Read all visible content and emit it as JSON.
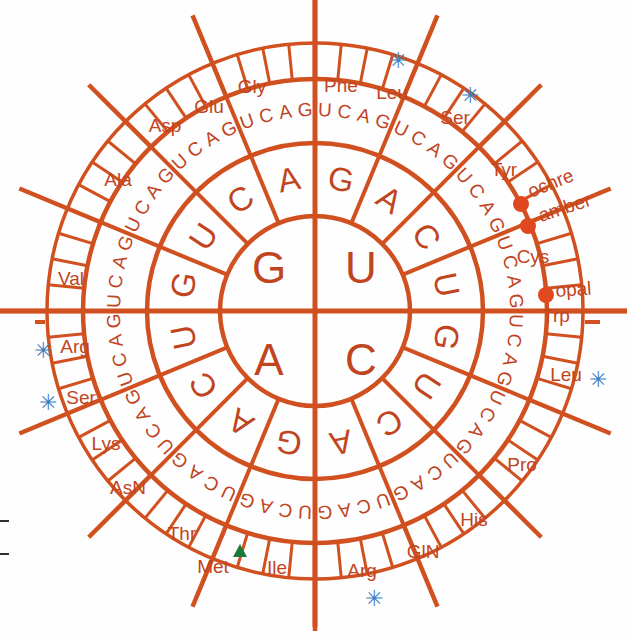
{
  "diagram": {
    "colors": {
      "line": "#d1501f",
      "text": "#c0451f",
      "asterisk": "#3f7fbf",
      "start_marker": "#1a7a3c",
      "stop_dot": "#e0491f",
      "background": "#ffffff"
    },
    "center": {
      "quadrants": [
        {
          "base": "G",
          "position": "top-left"
        },
        {
          "base": "U",
          "position": "top-right"
        },
        {
          "base": "A",
          "position": "bottom-left"
        },
        {
          "base": "C",
          "position": "bottom-right"
        }
      ]
    },
    "ring2_bases": [
      "G",
      "A",
      "C",
      "U",
      "G",
      "U",
      "C",
      "A",
      "G",
      "A",
      "C",
      "U",
      "G",
      "U",
      "C",
      "A"
    ],
    "ring3_bases": [
      "U",
      "C",
      "A",
      "G"
    ],
    "amino_acids": [
      {
        "label": "Gly",
        "x": 252,
        "y": 93,
        "anchor": "middle",
        "rot": 0
      },
      {
        "label": "Phe",
        "x": 341,
        "y": 92,
        "anchor": "middle",
        "rot": 0
      },
      {
        "label": "Leu",
        "x": 392,
        "y": 99,
        "anchor": "middle",
        "rot": 0
      },
      {
        "label": "Ser",
        "x": 455,
        "y": 124,
        "anchor": "middle",
        "rot": 0
      },
      {
        "label": "Tyr",
        "x": 504,
        "y": 176,
        "anchor": "middle",
        "rot": 0
      },
      {
        "label": "Cys",
        "x": 533,
        "y": 263,
        "anchor": "middle",
        "rot": 0
      },
      {
        "label": "Trp",
        "x": 556,
        "y": 322,
        "anchor": "middle",
        "rot": 0
      },
      {
        "label": "Leu",
        "x": 566,
        "y": 381,
        "anchor": "middle",
        "rot": 0
      },
      {
        "label": "Pro",
        "x": 522,
        "y": 471,
        "anchor": "middle",
        "rot": 0
      },
      {
        "label": "His",
        "x": 474,
        "y": 526,
        "anchor": "middle",
        "rot": 0
      },
      {
        "label": "GlN",
        "x": 423,
        "y": 558,
        "anchor": "middle",
        "rot": 0
      },
      {
        "label": "Arg",
        "x": 362,
        "y": 577,
        "anchor": "middle",
        "rot": 0
      },
      {
        "label": "Ile",
        "x": 277,
        "y": 574,
        "anchor": "middle",
        "rot": 0
      },
      {
        "label": "Met",
        "x": 213,
        "y": 573,
        "anchor": "middle",
        "rot": 0
      },
      {
        "label": "Thr",
        "x": 182,
        "y": 540,
        "anchor": "middle",
        "rot": 0
      },
      {
        "label": "AsN",
        "x": 128,
        "y": 494,
        "anchor": "middle",
        "rot": 0
      },
      {
        "label": "Lys",
        "x": 106,
        "y": 450,
        "anchor": "middle",
        "rot": 0
      },
      {
        "label": "Ser",
        "x": 81,
        "y": 404,
        "anchor": "middle",
        "rot": 0
      },
      {
        "label": "Arg",
        "x": 75,
        "y": 353,
        "anchor": "middle",
        "rot": 0
      },
      {
        "label": "Val",
        "x": 71,
        "y": 285,
        "anchor": "middle",
        "rot": 0
      },
      {
        "label": "Ala",
        "x": 118,
        "y": 186,
        "anchor": "middle",
        "rot": 0
      },
      {
        "label": "Asp",
        "x": 165,
        "y": 132,
        "anchor": "middle",
        "rot": 0
      },
      {
        "label": "Glu",
        "x": 209,
        "y": 113,
        "anchor": "middle",
        "rot": 0
      }
    ],
    "stop_codons": [
      {
        "label": "ochre",
        "x": 531,
        "y": 198,
        "dot_x": 521,
        "dot_y": 204,
        "rot": -22
      },
      {
        "label": "amber",
        "x": 541,
        "y": 222,
        "dot_x": 528,
        "dot_y": 226,
        "rot": -18
      },
      {
        "label": "opal",
        "x": 556,
        "y": 297,
        "dot_x": 546,
        "dot_y": 295,
        "rot": -4
      }
    ],
    "start_codon": {
      "label": "Met",
      "marker": "triangle",
      "x": 240,
      "y": 551
    },
    "asterisks": [
      {
        "glyph": "✳",
        "x": 398,
        "y": 68,
        "note": "Leu"
      },
      {
        "glyph": "✳",
        "x": 470,
        "y": 103,
        "note": "Ser"
      },
      {
        "glyph": "✳",
        "x": 598,
        "y": 387,
        "note": "Leu"
      },
      {
        "glyph": "✳",
        "x": 374,
        "y": 606,
        "note": "Arg"
      },
      {
        "glyph": "✳",
        "x": 43,
        "y": 358,
        "note": "Arg"
      },
      {
        "glyph": "✳",
        "x": 48,
        "y": 410,
        "note": "Ser"
      }
    ]
  }
}
